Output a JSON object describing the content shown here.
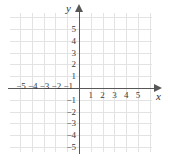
{
  "figure": {
    "kind": "cartesian-coordinate-plane",
    "axis_names": {
      "x": "x",
      "y": "y"
    },
    "colors": {
      "grid": "#e3e3e3",
      "axis": "#575757",
      "label": "#3a3a3a",
      "background": "#ffffff"
    }
  },
  "chart_data": {
    "type": "scatter",
    "title": "",
    "xlabel": "x",
    "ylabel": "y",
    "xlim": [
      -6,
      6
    ],
    "ylim": [
      -6,
      6
    ],
    "grid": true,
    "legend": false,
    "x": [],
    "y": [],
    "series": [],
    "x_ticks": [
      -5,
      -4,
      -3,
      -2,
      -1,
      1,
      2,
      3,
      4,
      5
    ],
    "y_ticks": [
      5,
      4,
      3,
      2,
      1,
      -1,
      -2,
      -3,
      -4,
      -5
    ],
    "x_tick_labels": [
      "−5",
      "−4",
      "−3",
      "−2",
      "−1",
      "1",
      "2",
      "3",
      "4",
      "5"
    ],
    "y_tick_labels_positive": [
      "5",
      "4",
      "3",
      "2",
      "1"
    ],
    "y_tick_labels_negative": [
      "−1",
      "−2",
      "−3",
      "−4",
      "−5"
    ]
  },
  "ticks": {
    "x_negative": [
      {
        "label": "−5",
        "value": -5
      },
      {
        "label": "−4",
        "value": -4
      },
      {
        "label": "−3",
        "value": -3
      },
      {
        "label": "−2",
        "value": -2
      },
      {
        "label": "−1",
        "value": -1
      }
    ],
    "x_positive": [
      {
        "label": "1",
        "value": 1
      },
      {
        "label": "2",
        "value": 2
      },
      {
        "label": "3",
        "value": 3
      },
      {
        "label": "4",
        "value": 4
      },
      {
        "label": "5",
        "value": 5
      }
    ],
    "y_positive": [
      {
        "label": "5",
        "value": 5
      },
      {
        "label": "4",
        "value": 4
      },
      {
        "label": "3",
        "value": 3
      },
      {
        "label": "2",
        "value": 2
      },
      {
        "label": "1",
        "value": 1
      }
    ],
    "y_negative": [
      {
        "label": "−1",
        "value": -1
      },
      {
        "label": "−2",
        "value": -2
      },
      {
        "label": "−3",
        "value": -3
      },
      {
        "label": "−4",
        "value": -4
      },
      {
        "label": "−5",
        "value": -5
      }
    ]
  }
}
